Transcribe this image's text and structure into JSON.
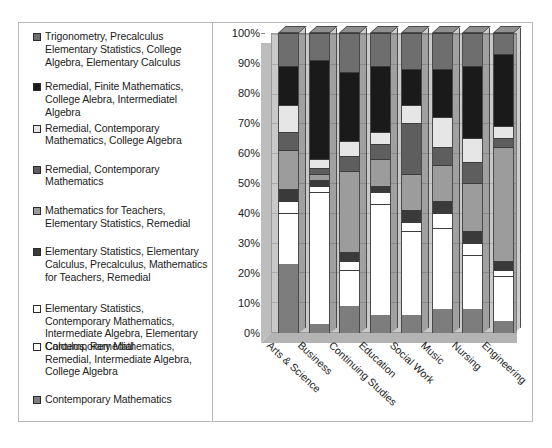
{
  "top_sliver_text": "",
  "chart_data": {
    "type": "bar",
    "subtype": "stacked-column-100-percent-3d",
    "title": "",
    "xlabel": "",
    "ylabel": "",
    "ylim": [
      0,
      100
    ],
    "grid": true,
    "legend_position": "left",
    "categories": [
      "Arts & Science",
      "Business",
      "Continuing Studies",
      "Education",
      "Social Work",
      "Music",
      "Nursing",
      "Engineering"
    ],
    "ytick_labels": [
      "0%",
      "10%",
      "20%",
      "30%",
      "40%",
      "50%",
      "60%",
      "70%",
      "80%",
      "90%",
      "100%"
    ],
    "ytick_values": [
      0,
      10,
      20,
      30,
      40,
      50,
      60,
      70,
      80,
      90,
      100
    ],
    "series": [
      {
        "name": "Contemporary Mathematics",
        "swatch": "#7d7d7d",
        "values": [
          23,
          3,
          9,
          6,
          6,
          8,
          8,
          4
        ]
      },
      {
        "name": "Contemporary Mathematics, Remedial, Intermediate Algebra, College Algebra",
        "swatch": "#ffffff",
        "values": [
          17,
          44,
          12,
          37,
          28,
          27,
          18,
          15
        ]
      },
      {
        "name": "Elementary Statistics, Contemporary Mathematics, Intermediate Algebra, Elementary Calculus, Remedial",
        "swatch": "#ffffff",
        "values": [
          4,
          2,
          3,
          4,
          3,
          5,
          4,
          2
        ]
      },
      {
        "name": "Elementary Statistics, Elementary Calculus, Precalculus, Mathematics for Teachers, Remedial",
        "swatch": "#3a3a3a",
        "values": [
          4,
          2,
          3,
          2,
          4,
          4,
          4,
          3
        ]
      },
      {
        "name": "Mathematics for Teachers, Elementary Statistics, Remedial",
        "swatch": "#9c9c9c",
        "values": [
          13,
          2,
          27,
          9,
          12,
          12,
          16,
          38
        ]
      },
      {
        "name": "Remedial, Contemporary Mathematics",
        "swatch": "#5e5e5e",
        "values": [
          6,
          2,
          5,
          5,
          17,
          6,
          7,
          3
        ]
      },
      {
        "name": "Remedial, Contemporary Mathematics, College Algebra",
        "swatch": "#e6e6e6",
        "values": [
          9,
          3,
          5,
          4,
          6,
          10,
          8,
          4
        ]
      },
      {
        "name": "Remedial, Finite Mathematics, College Alebra, Intermediatel Algebra",
        "swatch": "#1a1a1a",
        "values": [
          13,
          33,
          23,
          22,
          12,
          16,
          24,
          24
        ]
      },
      {
        "name": "Trigonometry, Precalculus Elementary Statistics, College Algebra, Elementary Calculus",
        "swatch": "#6e6e6e",
        "values": [
          11,
          9,
          13,
          11,
          12,
          12,
          11,
          7
        ]
      }
    ]
  },
  "legend": {
    "items": [
      {
        "label": "Trigonometry, Precalculus Elementary Statistics, College Algebra, Elementary Calculus",
        "swatch": "#6e6e6e"
      },
      {
        "label": "Remedial, Finite Mathematics, College Alebra, Intermediatel Algebra",
        "swatch": "#1a1a1a"
      },
      {
        "label": "Remedial, Contemporary Mathematics, College Algebra",
        "swatch": "#e6e6e6"
      },
      {
        "label": "Remedial, Contemporary Mathematics",
        "swatch": "#5e5e5e"
      },
      {
        "label": "Mathematics for Teachers, Elementary Statistics, Remedial",
        "swatch": "#9c9c9c"
      },
      {
        "label": "Elementary Statistics, Elementary Calculus, Precalculus, Mathematics for Teachers, Remedial",
        "swatch": "#3a3a3a"
      },
      {
        "label": "Elementary Statistics, Contemporary Mathematics, Intermediate Algebra, Elementary Calculus, Remedial",
        "swatch": "#ffffff"
      },
      {
        "label": "Contemporary Mathematics, Remedial, Intermediate Algebra, College Algebra",
        "swatch": "#ffffff"
      },
      {
        "label": "Contemporary Mathematics",
        "swatch": "#7d7d7d"
      }
    ]
  }
}
